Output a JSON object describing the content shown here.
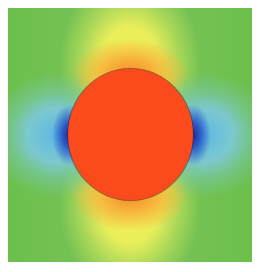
{
  "figure": {
    "colors": {
      "background_field": "#6cc04a",
      "high_lobes": "#f6f25a",
      "peak_near_inclusion": "#f58a2a",
      "low_lobes": "#5cb8e4",
      "minimum": "#1a2a9a",
      "inclusion": "#fb4a1c"
    }
  }
}
